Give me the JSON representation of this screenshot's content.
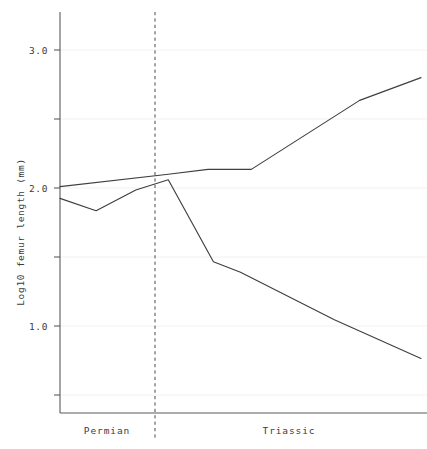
{
  "chart_data": {
    "type": "line",
    "title": "",
    "subtitle": "",
    "xlabel": "",
    "ylabel": "Log10 femur length (mm)",
    "xlim": [
      0,
      10
    ],
    "ylim": [
      0.55,
      3.45
    ],
    "grid": true,
    "legend_position": "none",
    "y_ticks_major": [
      1.0,
      2.0,
      3.0
    ],
    "y_ticks_major_labels": [
      "1.0",
      "2.0",
      "3.0"
    ],
    "y_ticks_minor": [
      0.5,
      1.5,
      2.5,
      3.5
    ],
    "x_period_labels": [
      {
        "label": "Permian",
        "center": 1.55
      },
      {
        "label": "Triassic",
        "center": 6.3
      }
    ],
    "annotations": [
      {
        "name": "permian-triassic-boundary",
        "type": "vline",
        "x": 3.0,
        "style": "dashed"
      }
    ],
    "series": [
      {
        "name": "upper-trend",
        "points": [
          {
            "x": 0.0,
            "y": 2.01
          },
          {
            "x": 3.0,
            "y": 2.1
          },
          {
            "x": 4.1,
            "y": 2.135
          },
          {
            "x": 5.3,
            "y": 2.135
          },
          {
            "x": 8.3,
            "y": 2.635
          },
          {
            "x": 10.0,
            "y": 2.8
          }
        ]
      },
      {
        "name": "lower-trend",
        "points": [
          {
            "x": 0.0,
            "y": 1.925
          },
          {
            "x": 1.0,
            "y": 1.835
          },
          {
            "x": 2.1,
            "y": 1.985
          },
          {
            "x": 3.0,
            "y": 2.06
          },
          {
            "x": 4.25,
            "y": 1.465
          },
          {
            "x": 5.0,
            "y": 1.39
          },
          {
            "x": 7.6,
            "y": 1.045
          },
          {
            "x": 10.0,
            "y": 0.765
          }
        ]
      }
    ]
  },
  "axes": {
    "y_title": "Log10 femur length (mm)"
  }
}
